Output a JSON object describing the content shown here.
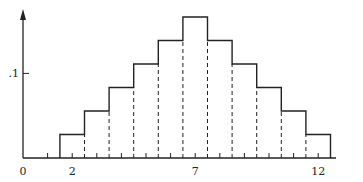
{
  "chart_data": {
    "type": "bar",
    "title": "",
    "xlabel": "",
    "ylabel": "",
    "categories": [
      2,
      3,
      4,
      5,
      6,
      7,
      8,
      9,
      10,
      11,
      12
    ],
    "values": [
      0.0278,
      0.0556,
      0.0833,
      0.1111,
      0.1389,
      0.1667,
      0.1389,
      0.1111,
      0.0833,
      0.0556,
      0.0278
    ],
    "values_fraction": [
      "1/36",
      "2/36",
      "3/36",
      "4/36",
      "5/36",
      "6/36",
      "5/36",
      "4/36",
      "3/36",
      "2/36",
      "1/36"
    ],
    "x_tick_labels": [
      "0",
      "2",
      "7",
      "12"
    ],
    "x_tick_positions": [
      0,
      2,
      7,
      12
    ],
    "x_minor_ticks": [
      1,
      2,
      3,
      4,
      5,
      6,
      7,
      8,
      9,
      10,
      11,
      12
    ],
    "y_tick_labels": [
      ".1"
    ],
    "y_tick_positions": [
      0.1
    ],
    "xlim": [
      0,
      13.5
    ],
    "ylim": [
      0,
      0.19
    ],
    "grid": false,
    "legend": null,
    "style": "histogram with dashed internal dividers"
  },
  "axis": {
    "origin_label": "0",
    "y_label": ".1",
    "x_labels": [
      {
        "text": "2",
        "x": 2
      },
      {
        "text": "7",
        "x": 7
      },
      {
        "text": "12",
        "x": 12
      }
    ]
  }
}
